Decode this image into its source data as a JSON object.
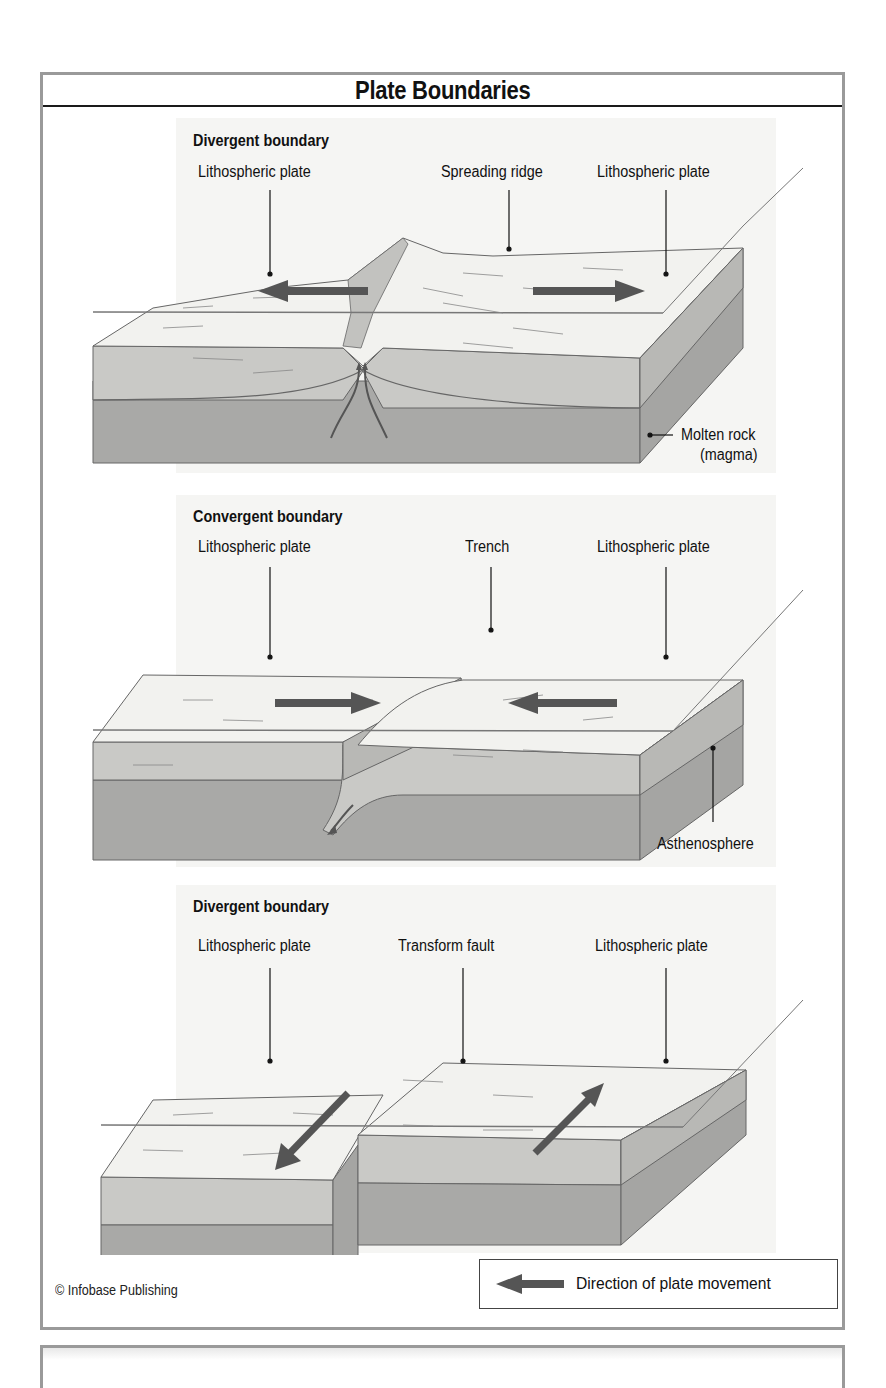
{
  "figure": {
    "title": "Plate Boundaries",
    "credit": "© Infobase Publishing",
    "colors": {
      "frame": "#9a9a9a",
      "surface": "#f2f2ef",
      "crust": "#c9c9c6",
      "mantle": "#a9a9a7",
      "side_crust": "#b3b3b0",
      "side_mantle": "#959593",
      "arrow": "#555555",
      "background_panel": "#f4f4f2"
    }
  },
  "panels": [
    {
      "heading": "Divergent boundary",
      "labels": {
        "left_plate": "Lithospheric plate",
        "center": "Spreading ridge",
        "right_plate": "Lithospheric plate",
        "side": "Molten rock",
        "side_line2": "(magma)"
      },
      "arrows": [
        "left",
        "right"
      ]
    },
    {
      "heading": "Convergent boundary",
      "labels": {
        "left_plate": "Lithospheric plate",
        "center": "Trench",
        "right_plate": "Lithospheric plate",
        "side": "Asthenosphere"
      },
      "arrows": [
        "right",
        "left"
      ]
    },
    {
      "heading": "Divergent boundary",
      "labels": {
        "left_plate": "Lithospheric plate",
        "center": "Transform fault",
        "right_plate": "Lithospheric plate"
      },
      "arrows": [
        "down-left",
        "up-right"
      ]
    }
  ],
  "legend": {
    "icon": "left-arrow-icon",
    "label": "Direction of plate movement"
  }
}
